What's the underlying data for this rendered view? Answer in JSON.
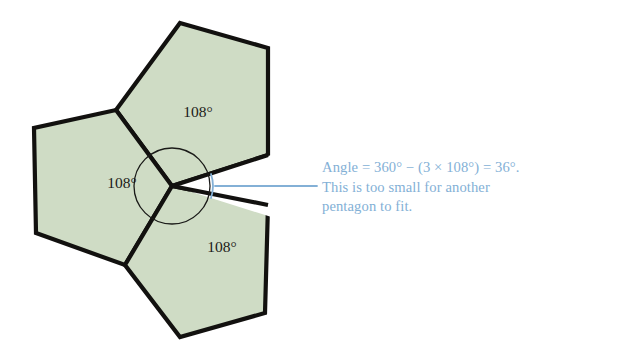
{
  "figure": {
    "colors": {
      "pentagon_fill": "#cfdcc5",
      "pentagon_stroke": "#12110f",
      "annotation_blue": "#83b0d6",
      "label_text": "#1c1b18",
      "background": "#ffffff"
    },
    "labels": {
      "top_pentagon_angle": "108°",
      "left_pentagon_angle": "108°",
      "bottom_pentagon_angle": "108°"
    },
    "caption": {
      "line1": "Angle = 360° − (3 × 108°) = 36°.",
      "line2": "This is too small for another",
      "line3": "pentagon to fit."
    },
    "geometry": {
      "center_vertex": [
        172,
        186
      ],
      "vertex_circle_radius": 38,
      "gap_angle_degrees": 36,
      "pentagon_interior_angle_degrees": 108,
      "pentagon_count": 3,
      "total_angle_degrees": 360
    }
  }
}
